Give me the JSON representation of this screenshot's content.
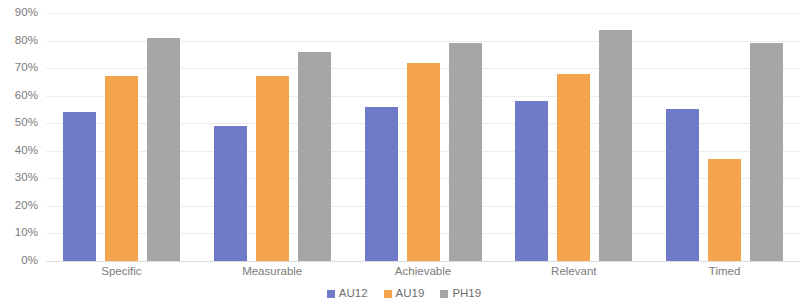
{
  "chart_data": {
    "type": "bar",
    "title": "",
    "xlabel": "",
    "ylabel": "",
    "ylim": [
      0,
      0.9
    ],
    "grid": true,
    "legend_position": "bottom",
    "categories": [
      "Specific",
      "Measurable",
      "Achievable",
      "Relevant",
      "Timed"
    ],
    "y_tick_labels": [
      "90%",
      "80%",
      "70%",
      "60%",
      "50%",
      "40%",
      "30%",
      "20%",
      "10%",
      "0%"
    ],
    "y_tick_values": [
      90,
      80,
      70,
      60,
      50,
      40,
      30,
      20,
      10,
      0
    ],
    "series": [
      {
        "name": "AU12",
        "color": "#6f7ac9",
        "values": [
          54,
          49,
          56,
          58,
          55
        ],
        "value_labels": [
          "54%",
          "49%",
          "56%",
          "58%",
          "55%"
        ]
      },
      {
        "name": "AU19",
        "color": "#f4a44c",
        "values": [
          67,
          67,
          72,
          68,
          37
        ],
        "value_labels": [
          "67%",
          "67%",
          "72%",
          "68%",
          "37%"
        ]
      },
      {
        "name": "PH19",
        "color": "#a6a6a6",
        "values": [
          81,
          76,
          79,
          84,
          79
        ],
        "value_labels": [
          "81%",
          "76%",
          "79%",
          "84%",
          "79%"
        ]
      }
    ]
  },
  "legend": {
    "items": [
      {
        "label": "AU12",
        "color": "#6f7ac9"
      },
      {
        "label": "AU19",
        "color": "#f4a44c"
      },
      {
        "label": "PH19",
        "color": "#a6a6a6"
      }
    ]
  },
  "colors": {
    "series_au12": "#6f7ac9",
    "series_au19": "#f4a44c",
    "series_ph19": "#a6a6a6",
    "gridline": "#ededed",
    "axis_text": "#7b7b7b",
    "background": "#ffffff"
  }
}
